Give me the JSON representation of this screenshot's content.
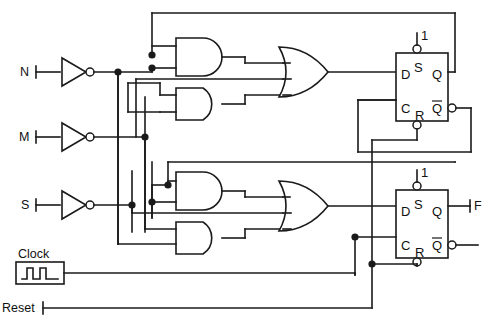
{
  "diagram": {
    "background_color": "#ffffff",
    "line_color": "#1a1a1a"
  },
  "inputs": [
    {
      "id": "in-n",
      "label": "N",
      "x": 22,
      "y": 72
    },
    {
      "id": "in-m",
      "label": "M",
      "x": 22,
      "y": 137
    },
    {
      "id": "in-s",
      "label": "S",
      "x": 22,
      "y": 205
    },
    {
      "id": "in-clock",
      "label": "Clock",
      "x": 18,
      "y": 258
    },
    {
      "id": "in-reset",
      "label": "Reset",
      "x": 2,
      "y": 308
    }
  ],
  "outputs": [
    {
      "id": "out-f",
      "label": "F",
      "x": 478,
      "y": 209
    }
  ],
  "inverters": [
    {
      "id": "inv-n",
      "input_label": "N"
    },
    {
      "id": "inv-m",
      "input_label": "M"
    },
    {
      "id": "inv-s",
      "input_label": "S"
    }
  ],
  "and_gates": [
    {
      "id": "and-1",
      "inputs": 2
    },
    {
      "id": "and-2",
      "inputs": 2
    },
    {
      "id": "and-3",
      "inputs": 2
    },
    {
      "id": "and-4",
      "inputs": 2
    }
  ],
  "or_gates": [
    {
      "id": "or-1",
      "inputs": 3
    },
    {
      "id": "or-2",
      "inputs": 3
    }
  ],
  "flipflops": [
    {
      "id": "ff-1",
      "preset_label": "1",
      "pins": {
        "d": "D",
        "clk": "C",
        "set": "S",
        "reset": "R",
        "q": "Q",
        "qbar": "Q"
      }
    },
    {
      "id": "ff-2",
      "preset_label": "1",
      "pins": {
        "d": "D",
        "clk": "C",
        "set": "S",
        "reset": "R",
        "q": "Q",
        "qbar": "Q"
      }
    }
  ],
  "clock_source": {
    "label": "Clock",
    "waveform": "square-pulse-train"
  }
}
